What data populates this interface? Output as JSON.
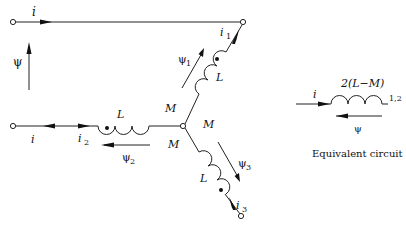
{
  "diagram": {
    "labels": {
      "top_current": "i",
      "left_flux": "ψ",
      "i1": "i",
      "i1_sub": "1",
      "psi1": "ψ",
      "psi1_sub": "1",
      "L_upper": "L",
      "M_upper_left": "M",
      "M_right": "M",
      "M_lower": "M",
      "L_left": "L",
      "left_current": "i",
      "i2": "i",
      "i2_sub": "2",
      "psi2": "ψ",
      "psi2_sub": "2",
      "L_lower": "L",
      "psi3": "ψ",
      "psi3_sub": "3",
      "i3": "i",
      "i3_sub": "3"
    },
    "equivalent": {
      "inductance": "2(L−M)",
      "current": "i",
      "terminal": "1,2",
      "flux": "ψ",
      "caption": "Equivalent circuit"
    },
    "colors": {
      "stroke": "#222222",
      "background": "#ffffff"
    }
  }
}
